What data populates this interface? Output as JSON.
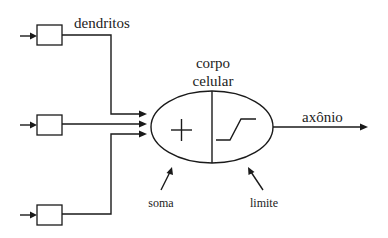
{
  "diagram": {
    "labels": {
      "dendrites": "dendritos",
      "cell_body_line1": "corpo",
      "cell_body_line2": "celular",
      "axon": "axônio",
      "sum": "soma",
      "threshold": "limite"
    },
    "symbols": {
      "sum_symbol": "+",
      "threshold_symbol": "step-function"
    },
    "inputs": [
      {
        "name": "input-1",
        "y": 36
      },
      {
        "name": "input-2",
        "y": 127
      },
      {
        "name": "input-3",
        "y": 215
      }
    ],
    "colors": {
      "stroke": "#1a1a1a",
      "text": "#222222",
      "background": "#ffffff"
    }
  }
}
